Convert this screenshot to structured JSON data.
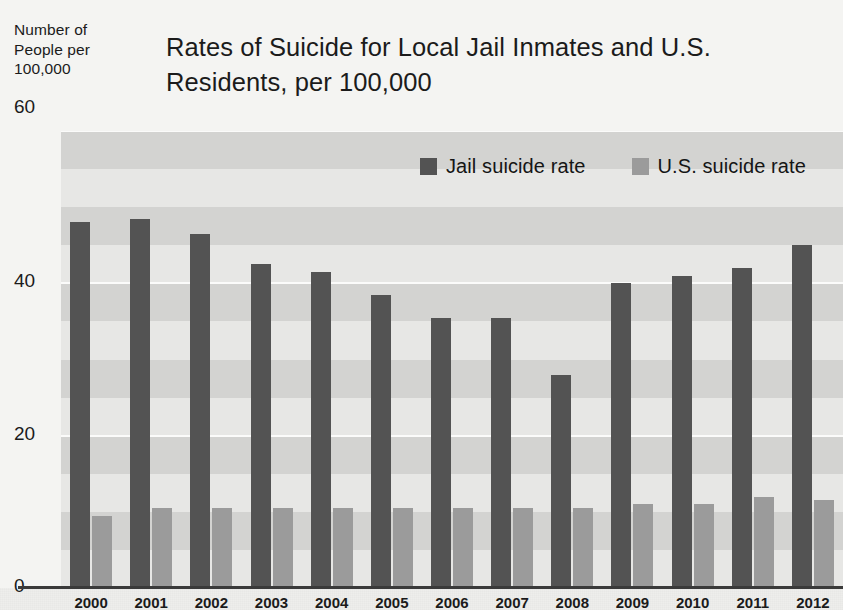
{
  "header": {
    "axis_caption": "Number of People per 100,000",
    "top_tick": "60",
    "title": "Rates of Suicide for Local Jail Inmates and U.S. Residents, per 100,000"
  },
  "legend": {
    "items": [
      {
        "label": "Jail suicide rate",
        "color": "#535353",
        "swatch": "legend-swatch-jail"
      },
      {
        "label": "U.S. suicide rate",
        "color": "#9b9b9b",
        "swatch": "legend-swatch-us"
      }
    ]
  },
  "y_axis": {
    "ticks": [
      "60",
      "40",
      "20",
      "0"
    ],
    "values": [
      60,
      40,
      20,
      0
    ]
  },
  "chart_data": {
    "type": "bar",
    "title": "Rates of Suicide for Local Jail Inmates and U.S. Residents, per 100,000",
    "subtitle": "",
    "xlabel": "",
    "ylabel": "Number of People per 100,000",
    "ylim": [
      0,
      60
    ],
    "yticks": [
      0,
      20,
      40,
      60
    ],
    "grid": true,
    "legend_position": "top-center",
    "categories": [
      "2000",
      "2001",
      "2002",
      "2003",
      "2004",
      "2005",
      "2006",
      "2007",
      "2008",
      "2009",
      "2010",
      "2011",
      "2012"
    ],
    "series": [
      {
        "name": "Jail suicide rate",
        "color": "#535353",
        "values": [
          48,
          48.5,
          46.5,
          42.5,
          41.5,
          38.5,
          35.5,
          35.5,
          28,
          40,
          41,
          42,
          45
        ]
      },
      {
        "name": "U.S. suicide rate",
        "color": "#9b9b9b",
        "values": [
          9.5,
          10.5,
          10.5,
          10.5,
          10.5,
          10.5,
          10.5,
          10.5,
          10.5,
          11,
          11,
          12,
          11.5
        ]
      }
    ]
  }
}
